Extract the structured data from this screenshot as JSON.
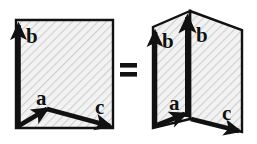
{
  "figure": {
    "background_color": "#ffffff",
    "ink_color": "#111111",
    "fill_color": "#f0f0f0",
    "hatch_color": "#c9c9c9",
    "relation_symbol": "=",
    "left_shape": {
      "name": "flat-square-panel",
      "kind": "square",
      "fill": "#f0f0f0",
      "hatched": true,
      "vectors": [
        {
          "id": "b",
          "label": "b",
          "direction": "up",
          "from": "bottom-left-corner",
          "to": "top-left-corner"
        },
        {
          "id": "a",
          "label": "a",
          "direction": "up-right",
          "from": "bottom-left-corner",
          "to": "interior-point"
        },
        {
          "id": "c",
          "label": "c",
          "direction": "right-down",
          "from": "interior-point",
          "to": "bottom-right-corner"
        }
      ]
    },
    "right_shape": {
      "name": "folded-two-panel",
      "kind": "folded-square",
      "fill": "#f0f0f0",
      "hatched": true,
      "panels": [
        "left-panel",
        "right-panel"
      ],
      "vectors": [
        {
          "id": "b-left",
          "label": "b",
          "direction": "up",
          "panel": "left-panel"
        },
        {
          "id": "b-right",
          "label": "b",
          "direction": "up",
          "panel": "right-panel",
          "on_fold": true
        },
        {
          "id": "a",
          "label": "a",
          "direction": "up-right",
          "panel": "left-panel"
        },
        {
          "id": "c",
          "label": "c",
          "direction": "right-down",
          "panel": "right-panel"
        }
      ]
    },
    "labels": {
      "left_b": "b",
      "left_a": "a",
      "left_c": "c",
      "right_b_left": "b",
      "right_b_fold": "b",
      "right_a": "a",
      "right_c": "c"
    }
  }
}
